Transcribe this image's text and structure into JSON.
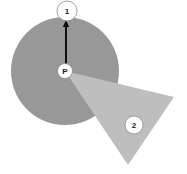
{
  "figure": {
    "background_color": "#ffffff",
    "width": 187,
    "height": 174
  },
  "shapes": [
    {
      "id": "circle",
      "name": "shaded-circle",
      "kind": "circle",
      "fill": "#989898",
      "cx": 65,
      "cy": 71,
      "r": 54
    },
    {
      "id": "triangle",
      "name": "shaded-triangle",
      "kind": "polygon",
      "fill": "#bebebe",
      "points": "65,71 174,97 128,165"
    }
  ],
  "vector": {
    "name": "radius-vector",
    "color": "#111111",
    "from": {
      "x": 66,
      "y": 71
    },
    "to": {
      "x": 66,
      "y": 20
    },
    "direction": "up",
    "has_arrowhead": true
  },
  "labels": {
    "shape_one": {
      "text": "1",
      "x": 67,
      "y": 11,
      "radius": 10
    },
    "center_point": {
      "text": "P",
      "x": 65,
      "y": 71,
      "radius": 7.5
    },
    "shape_two": {
      "text": "2",
      "x": 134,
      "y": 125,
      "radius": 9
    }
  }
}
